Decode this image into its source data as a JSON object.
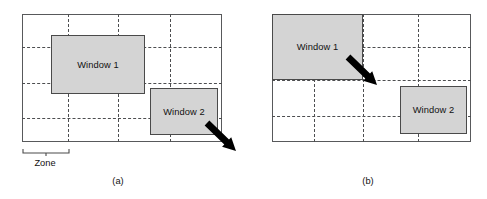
{
  "figure": {
    "width": 487,
    "height": 199,
    "background": "#ffffff",
    "stroke_color": "#58595b",
    "window_fill": "#d4d4d4",
    "window_stroke": "#4a4a4a",
    "grid_color": "#4d4e50"
  },
  "panels": [
    {
      "id": "a",
      "caption": "(a)",
      "frame": {
        "x": 22,
        "y": 14,
        "w": 200,
        "h": 128
      },
      "grid": {
        "vertical_x": [
          68,
          118,
          170
        ],
        "horizontal_y": [
          47,
          83,
          118
        ]
      },
      "windows": [
        {
          "label": "Window 1",
          "x": 51,
          "y": 35,
          "w": 94,
          "h": 59
        },
        {
          "label": "Window 2",
          "x": 150,
          "y": 88,
          "w": 68,
          "h": 47
        }
      ],
      "cursor": {
        "tip_x": 236,
        "tip_y": 151,
        "tail_x": 207,
        "tail_y": 123
      },
      "zone": {
        "label": "Zone",
        "bracket_x": 22,
        "bracket_y": 148,
        "bracket_w": 46,
        "label_y": 158
      }
    },
    {
      "id": "b",
      "caption": "(b)",
      "frame": {
        "x": 272,
        "y": 14,
        "w": 199,
        "h": 128
      },
      "grid": {
        "vertical_x": [
          314,
          363,
          418
        ],
        "horizontal_y": [
          47,
          80,
          116
        ]
      },
      "windows": [
        {
          "label": "Window 1",
          "x": 272,
          "y": 14,
          "w": 91,
          "h": 66
        },
        {
          "label": "Window 2",
          "x": 400,
          "y": 86,
          "w": 67,
          "h": 48
        }
      ],
      "cursor": {
        "tip_x": 377,
        "tip_y": 85,
        "tail_x": 348,
        "tail_y": 57
      }
    }
  ],
  "captions": {
    "a": {
      "text": "(a)",
      "x": 118,
      "y": 176
    },
    "b": {
      "text": "(b)",
      "x": 368,
      "y": 176
    }
  }
}
